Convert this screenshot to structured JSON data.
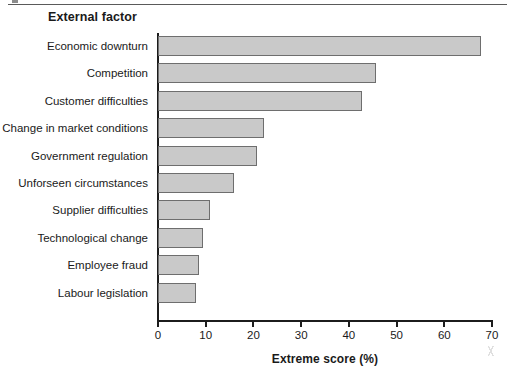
{
  "chart_data": {
    "type": "bar",
    "orientation": "horizontal",
    "title": "External factor",
    "xlabel": "Extreme score (%)",
    "ylabel": "External factor",
    "xlim": [
      0,
      70
    ],
    "xticks": [
      0,
      10,
      20,
      30,
      40,
      50,
      60,
      70
    ],
    "xtick_labels": [
      "0",
      "10",
      "20",
      "30",
      "40",
      "50",
      "60",
      "70"
    ],
    "grid": false,
    "legend": null,
    "bar_color": "#c9c9c9",
    "bar_edge_color": "#6e6e6e",
    "axis_color": "#1c1c1c",
    "categories": [
      "Economic downturn",
      "Competition",
      "Customer difficulties",
      "Change in market conditions",
      "Government regulation",
      "Unforseen circumstances",
      "Supplier difficulties",
      "Technological change",
      "Employee fraud",
      "Labour legislation"
    ],
    "values": [
      67.7,
      45.7,
      42.8,
      22.2,
      20.8,
      16.0,
      11.0,
      9.5,
      8.6,
      8.0
    ]
  }
}
